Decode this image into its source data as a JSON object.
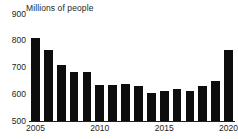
{
  "chart_data": {
    "type": "bar",
    "title": "Millions of people",
    "xlabel": "",
    "ylabel": "Millions of people",
    "categories": [
      "2005",
      "2006",
      "2007",
      "2008",
      "2009",
      "2010",
      "2011",
      "2012",
      "2013",
      "2014",
      "2015",
      "2016",
      "2017",
      "2018",
      "2019",
      "2020"
    ],
    "values": [
      810,
      765,
      710,
      685,
      683,
      635,
      635,
      637,
      630,
      605,
      612,
      618,
      612,
      632,
      648,
      766
    ],
    "ylim": [
      500,
      900
    ],
    "yticks": [
      900,
      800,
      700,
      600,
      500
    ],
    "ytick_labels": [
      "900",
      "800",
      "700",
      "600",
      "500"
    ],
    "xtick_labels": [
      "2005",
      "2010",
      "2015",
      "2020"
    ],
    "xtick_categories": [
      "2005",
      "2010",
      "2015",
      "2020"
    ],
    "grid": false,
    "legend": null,
    "bar_color": "#0d0d0d",
    "axis_color": "#231f20",
    "background": "#ffffff"
  }
}
